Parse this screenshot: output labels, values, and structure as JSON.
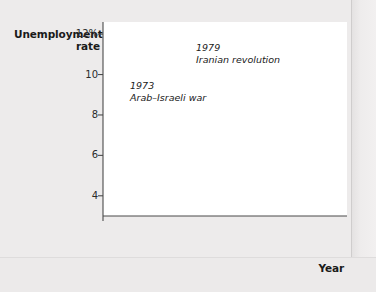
{
  "figure": {
    "background_color": "#edebeb",
    "plot_background_color": "#ffffff",
    "line_color": "#9c9c9c",
    "axis_color": "#4a4a4a"
  },
  "axes": {
    "y_title_line1": "Unemployment",
    "y_title_line2": "rate",
    "x_title": "Year",
    "y_ticks": [
      "12%",
      "10",
      "8",
      "6",
      "4"
    ],
    "x_ticks": [
      "1948",
      "1950",
      "1955",
      "1960",
      "1965",
      "1970",
      "1975",
      "1980",
      "1985",
      "1990",
      "1995",
      "2000",
      "2005",
      "2008"
    ],
    "axis_break": true
  },
  "annotations": [
    {
      "year": "1973",
      "text": "Arab–Israeli war"
    },
    {
      "year": "1979",
      "text": "Iranian revolution"
    }
  ],
  "chart_data": {
    "type": "line",
    "title": "",
    "xlabel": "Year",
    "ylabel": "Unemployment rate",
    "ylim": [
      3.0,
      12.6
    ],
    "xlim": [
      1948,
      2008.6
    ],
    "grid": false,
    "legend": "none",
    "y_tick_values": [
      12,
      10,
      8,
      6,
      4
    ],
    "y_tick_labels": [
      "12%",
      "10",
      "8",
      "6",
      "4"
    ],
    "x_tick_values": [
      1948,
      1950,
      1955,
      1960,
      1965,
      1970,
      1975,
      1980,
      1985,
      1990,
      1995,
      2000,
      2005,
      2008
    ],
    "axis_break_below": 4,
    "annotations": [
      {
        "x": 1973,
        "y": 9.0,
        "label_year": "1973",
        "label_text": "Arab–Israeli war",
        "leader_to_y": 6.2
      },
      {
        "x": 1979,
        "y": 11.6,
        "label_year": "1979",
        "label_text": "Iranian revolution",
        "leader_to_y": 6.1
      }
    ],
    "series": [
      {
        "name": "U.S. unemployment rate",
        "color": "#9c9c9c",
        "x": [
          1948.0,
          1948.5,
          1949.0,
          1949.5,
          1949.9,
          1950.3,
          1950.8,
          1951.3,
          1951.8,
          1952.3,
          1952.8,
          1953.2,
          1953.7,
          1954.0,
          1954.4,
          1954.8,
          1955.2,
          1955.8,
          1956.3,
          1956.8,
          1957.2,
          1957.7,
          1958.0,
          1958.3,
          1958.7,
          1959.2,
          1959.7,
          1960.2,
          1960.7,
          1961.0,
          1961.4,
          1961.9,
          1962.4,
          1962.9,
          1963.4,
          1963.9,
          1964.4,
          1964.9,
          1965.4,
          1965.9,
          1966.4,
          1966.9,
          1967.4,
          1967.9,
          1968.4,
          1968.9,
          1969.4,
          1969.9,
          1970.3,
          1970.8,
          1971.2,
          1971.7,
          1972.2,
          1972.7,
          1973.2,
          1973.7,
          1974.2,
          1974.7,
          1975.0,
          1975.4,
          1975.9,
          1976.4,
          1976.9,
          1977.4,
          1977.9,
          1978.4,
          1978.9,
          1979.4,
          1979.9,
          1980.3,
          1980.7,
          1981.2,
          1981.7,
          1982.2,
          1982.7,
          1982.9,
          1983.3,
          1983.8,
          1984.3,
          1984.8,
          1985.3,
          1985.8,
          1986.3,
          1986.8,
          1987.3,
          1987.8,
          1988.3,
          1988.8,
          1989.3,
          1989.8,
          1990.3,
          1990.8,
          1991.3,
          1991.8,
          1992.3,
          1992.7,
          1993.2,
          1993.7,
          1994.2,
          1994.7,
          1995.2,
          1995.7,
          1996.2,
          1996.7,
          1997.2,
          1997.7,
          1998.2,
          1998.7,
          1999.2,
          1999.7,
          2000.2,
          2000.7,
          2001.2,
          2001.7,
          2002.2,
          2002.7,
          2003.2,
          2003.6,
          2004.1,
          2004.6,
          2005.1,
          2005.6,
          2006.1,
          2006.6,
          2007.1,
          2007.6,
          2008.0,
          2008.3,
          2008.6
        ],
        "y": [
          3.8,
          3.7,
          4.6,
          6.6,
          7.9,
          6.4,
          5.0,
          3.3,
          3.1,
          3.0,
          3.2,
          2.9,
          2.7,
          3.7,
          5.5,
          5.9,
          5.2,
          4.2,
          4.1,
          4.0,
          4.1,
          4.3,
          5.8,
          7.4,
          6.8,
          5.5,
          5.2,
          5.1,
          5.9,
          6.6,
          7.0,
          6.7,
          5.7,
          5.5,
          5.7,
          5.5,
          5.2,
          5.0,
          4.7,
          4.2,
          3.8,
          3.7,
          3.8,
          3.8,
          3.6,
          3.4,
          3.4,
          3.5,
          4.4,
          5.5,
          6.0,
          5.9,
          5.8,
          5.3,
          4.9,
          4.8,
          5.3,
          6.0,
          8.1,
          8.9,
          8.4,
          7.7,
          7.8,
          7.4,
          6.9,
          6.1,
          5.9,
          5.8,
          6.0,
          6.9,
          7.5,
          7.4,
          8.3,
          9.7,
          10.8,
          10.4,
          10.1,
          8.8,
          7.5,
          7.2,
          7.3,
          7.0,
          7.1,
          6.9,
          6.2,
          5.9,
          5.5,
          5.3,
          5.2,
          5.4,
          5.3,
          5.9,
          6.8,
          7.0,
          7.6,
          7.4,
          7.1,
          6.6,
          6.4,
          5.9,
          5.6,
          5.6,
          5.5,
          5.2,
          5.0,
          4.7,
          4.5,
          4.4,
          4.3,
          4.1,
          4.0,
          3.9,
          4.4,
          5.0,
          5.7,
          5.8,
          6.0,
          6.3,
          5.8,
          5.6,
          5.4,
          5.1,
          4.8,
          4.7,
          4.5,
          4.6,
          5.0,
          5.6,
          6.1
        ]
      }
    ]
  }
}
